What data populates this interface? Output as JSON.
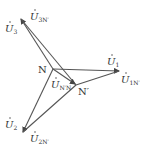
{
  "diagram": {
    "colors": {
      "line": "#555555",
      "text": "#333333",
      "background": "#ffffff"
    },
    "points": {
      "N": {
        "label": "N",
        "x": 53,
        "y": 69
      },
      "Nprime": {
        "label": "N′",
        "x": 76,
        "y": 85
      }
    },
    "phasors": [
      {
        "id": "U1",
        "base": "U",
        "sub": "1",
        "from": "N",
        "to": [
          120,
          71
        ]
      },
      {
        "id": "U2",
        "base": "U",
        "sub": "2",
        "from": "N",
        "to": [
          22,
          133
        ]
      },
      {
        "id": "U3",
        "base": "U",
        "sub": "3",
        "from": "N",
        "to": [
          20,
          18
        ]
      },
      {
        "id": "U1N",
        "base": "U",
        "sub": "1N′",
        "from": "Nprime",
        "to": [
          120,
          71
        ]
      },
      {
        "id": "U2N",
        "base": "U",
        "sub": "2N′",
        "from": "Nprime",
        "to": [
          22,
          133
        ]
      },
      {
        "id": "U3N",
        "base": "U",
        "sub": "3N′",
        "from": "Nprime",
        "to": [
          20,
          18
        ]
      },
      {
        "id": "UNN",
        "base": "U",
        "sub": "N′N",
        "from": "N",
        "to": "Nprime"
      }
    ],
    "labels": {
      "U1": {
        "base": "U",
        "sub": "1"
      },
      "U1N": {
        "base": "U",
        "sub": "1N′"
      },
      "U2": {
        "base": "U",
        "sub": "2"
      },
      "U2N": {
        "base": "U",
        "sub": "2N′"
      },
      "U3": {
        "base": "U",
        "sub": "3"
      },
      "U3N": {
        "base": "U",
        "sub": "3N′"
      },
      "UNN": {
        "base": "U",
        "sub": "N′N"
      },
      "N": "N",
      "Nprime": "N′"
    }
  }
}
